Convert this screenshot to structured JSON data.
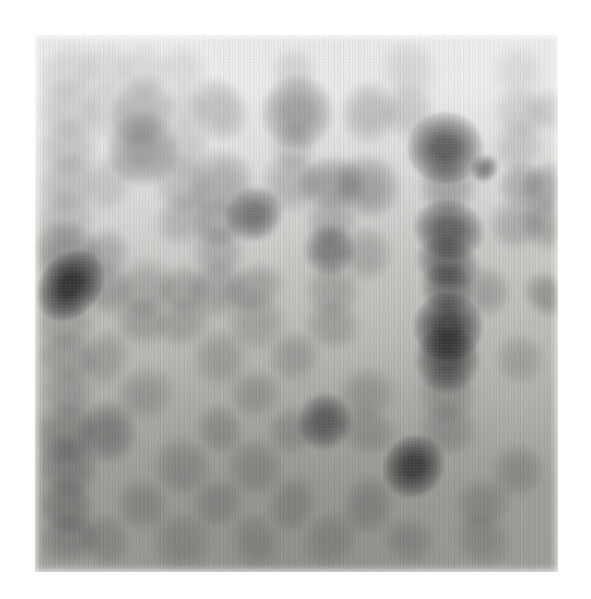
{
  "image": {
    "kind": "dot-blot-autoradiograph",
    "description": "Grayscale autoradiograph of a dot blot / macroarray membrane showing a grid of hybridization spots of varying intensity",
    "canvas_width": 591,
    "canvas_height": 599,
    "background_color": "#ffffff"
  },
  "membrane": {
    "x": 35,
    "y": 35,
    "width": 523,
    "height": 537,
    "tone_top": "#ececea",
    "tone_mid": "#c9c8c4",
    "tone_bottom": "#a7a6a2",
    "grain_color": "#7d7c78",
    "edge_softness_px": 7
  },
  "chart_data": {
    "type": "heatmap",
    "title": "",
    "subtitle": "",
    "xlabel": "",
    "ylabel": "",
    "grid": false,
    "legend": null,
    "columns": 14,
    "rows": 13,
    "col_centers": [
      68,
      105,
      143,
      181,
      218,
      256,
      293,
      330,
      368,
      410,
      447,
      484,
      520,
      547
    ],
    "row_centers": [
      70,
      108,
      145,
      183,
      220,
      248,
      283,
      320,
      355,
      392,
      428,
      466,
      505,
      540
    ],
    "intensity_scale": [
      0,
      1
    ],
    "spots": [
      {
        "col": 0,
        "row": 0,
        "x": 68,
        "y": 72,
        "r": 15,
        "intensity": 0.06
      },
      {
        "col": 1,
        "row": 0,
        "x": 106,
        "y": 70,
        "r": 14,
        "intensity": 0.05
      },
      {
        "col": 2,
        "row": 0,
        "x": 144,
        "y": 72,
        "r": 15,
        "intensity": 0.07
      },
      {
        "col": 3,
        "row": 0,
        "x": 182,
        "y": 70,
        "r": 14,
        "intensity": 0.05
      },
      {
        "col": 6,
        "row": 0,
        "x": 296,
        "y": 72,
        "r": 14,
        "intensity": 0.06
      },
      {
        "col": 9,
        "row": 0,
        "x": 410,
        "y": 72,
        "r": 14,
        "intensity": 0.05
      },
      {
        "col": 12,
        "row": 0,
        "x": 520,
        "y": 72,
        "r": 14,
        "intensity": 0.05
      },
      {
        "col": 0,
        "row": 1,
        "x": 68,
        "y": 110,
        "r": 16,
        "intensity": 0.14
      },
      {
        "col": 1,
        "row": 1,
        "x": 106,
        "y": 108,
        "r": 15,
        "intensity": 0.1
      },
      {
        "col": 2,
        "row": 1,
        "x": 144,
        "y": 110,
        "r": 18,
        "intensity": 0.4
      },
      {
        "col": 3,
        "row": 1,
        "x": 182,
        "y": 108,
        "r": 14,
        "intensity": 0.1
      },
      {
        "col": 4,
        "row": 1,
        "x": 219,
        "y": 110,
        "r": 16,
        "intensity": 0.26
      },
      {
        "col": 6,
        "row": 1,
        "x": 296,
        "y": 112,
        "r": 18,
        "intensity": 0.45
      },
      {
        "col": 8,
        "row": 1,
        "x": 370,
        "y": 110,
        "r": 15,
        "intensity": 0.22
      },
      {
        "col": 9,
        "row": 1,
        "x": 410,
        "y": 110,
        "r": 14,
        "intensity": 0.13
      },
      {
        "col": 12,
        "row": 1,
        "x": 520,
        "y": 112,
        "r": 14,
        "intensity": 0.12
      },
      {
        "col": 13,
        "row": 1,
        "x": 548,
        "y": 112,
        "r": 13,
        "intensity": 0.1
      },
      {
        "col": 0,
        "row": 2,
        "x": 68,
        "y": 147,
        "r": 16,
        "intensity": 0.16
      },
      {
        "col": 2,
        "row": 2,
        "x": 144,
        "y": 148,
        "r": 18,
        "intensity": 0.52
      },
      {
        "col": 3,
        "row": 2,
        "x": 182,
        "y": 146,
        "r": 15,
        "intensity": 0.14
      },
      {
        "col": 6,
        "row": 2,
        "x": 293,
        "y": 147,
        "r": 14,
        "intensity": 0.12
      },
      {
        "col": 10,
        "row": 2,
        "x": 447,
        "y": 147,
        "r": 20,
        "intensity": 0.88
      },
      {
        "col": 12,
        "row": 2,
        "x": 518,
        "y": 147,
        "r": 14,
        "intensity": 0.13
      },
      {
        "col": 0,
        "row": 3,
        "x": 68,
        "y": 184,
        "r": 15,
        "intensity": 0.15
      },
      {
        "col": 1,
        "row": 3,
        "x": 106,
        "y": 183,
        "r": 14,
        "intensity": 0.12
      },
      {
        "col": 3,
        "row": 3,
        "x": 182,
        "y": 184,
        "r": 15,
        "intensity": 0.18
      },
      {
        "col": 4,
        "row": 3,
        "x": 219,
        "y": 182,
        "r": 16,
        "intensity": 0.3
      },
      {
        "col": 6,
        "row": 3,
        "x": 293,
        "y": 184,
        "r": 14,
        "intensity": 0.2
      },
      {
        "col": 7,
        "row": 3,
        "x": 331,
        "y": 183,
        "r": 16,
        "intensity": 0.32
      },
      {
        "col": 8,
        "row": 3,
        "x": 368,
        "y": 184,
        "r": 16,
        "intensity": 0.3
      },
      {
        "col": 10,
        "row": 3,
        "x": 447,
        "y": 186,
        "r": 15,
        "intensity": 0.3
      },
      {
        "col": 11,
        "row": 3,
        "x": 484,
        "y": 167,
        "r": 7,
        "intensity": 0.62
      },
      {
        "col": 12,
        "row": 3,
        "x": 520,
        "y": 186,
        "r": 14,
        "intensity": 0.24
      },
      {
        "col": 13,
        "row": 3,
        "x": 548,
        "y": 186,
        "r": 14,
        "intensity": 0.26
      },
      {
        "col": 0,
        "row": 4,
        "x": 68,
        "y": 220,
        "r": 14,
        "intensity": 0.12
      },
      {
        "col": 3,
        "row": 4,
        "x": 182,
        "y": 218,
        "r": 15,
        "intensity": 0.2
      },
      {
        "col": 4,
        "row": 4,
        "x": 219,
        "y": 220,
        "r": 15,
        "intensity": 0.24
      },
      {
        "col": 5,
        "row": 4,
        "x": 256,
        "y": 213,
        "r": 14,
        "intensity": 0.66
      },
      {
        "col": 7,
        "row": 4,
        "x": 331,
        "y": 222,
        "r": 14,
        "intensity": 0.18
      },
      {
        "col": 10,
        "row": 4,
        "x": 447,
        "y": 228,
        "r": 18,
        "intensity": 0.7
      },
      {
        "col": 12,
        "row": 4,
        "x": 520,
        "y": 222,
        "r": 14,
        "intensity": 0.18
      },
      {
        "col": 13,
        "row": 4,
        "x": 548,
        "y": 224,
        "r": 14,
        "intensity": 0.2
      },
      {
        "col": 0,
        "row": 5,
        "x": 68,
        "y": 252,
        "r": 17,
        "intensity": 0.36
      },
      {
        "col": 1,
        "row": 5,
        "x": 106,
        "y": 252,
        "r": 14,
        "intensity": 0.2
      },
      {
        "col": 4,
        "row": 5,
        "x": 219,
        "y": 252,
        "r": 14,
        "intensity": 0.18
      },
      {
        "col": 7,
        "row": 5,
        "x": 328,
        "y": 252,
        "r": 14,
        "intensity": 0.48
      },
      {
        "col": 8,
        "row": 5,
        "x": 368,
        "y": 255,
        "r": 14,
        "intensity": 0.16
      },
      {
        "col": 10,
        "row": 5,
        "x": 447,
        "y": 262,
        "r": 15,
        "intensity": 0.58
      },
      {
        "col": 0,
        "row": 6,
        "x": 68,
        "y": 285,
        "r": 18,
        "intensity": 0.95
      },
      {
        "col": 1,
        "row": 6,
        "x": 106,
        "y": 287,
        "r": 14,
        "intensity": 0.22
      },
      {
        "col": 2,
        "row": 6,
        "x": 144,
        "y": 289,
        "r": 14,
        "intensity": 0.16
      },
      {
        "col": 3,
        "row": 6,
        "x": 182,
        "y": 289,
        "r": 14,
        "intensity": 0.18
      },
      {
        "col": 4,
        "row": 6,
        "x": 219,
        "y": 289,
        "r": 14,
        "intensity": 0.18
      },
      {
        "col": 5,
        "row": 6,
        "x": 256,
        "y": 289,
        "r": 14,
        "intensity": 0.18
      },
      {
        "col": 7,
        "row": 6,
        "x": 331,
        "y": 289,
        "r": 14,
        "intensity": 0.16
      },
      {
        "col": 10,
        "row": 6,
        "x": 447,
        "y": 289,
        "r": 15,
        "intensity": 0.5
      },
      {
        "col": 11,
        "row": 6,
        "x": 484,
        "y": 292,
        "r": 13,
        "intensity": 0.18
      },
      {
        "col": 13,
        "row": 6,
        "x": 548,
        "y": 296,
        "r": 13,
        "intensity": 0.26
      },
      {
        "col": 0,
        "row": 7,
        "x": 68,
        "y": 322,
        "r": 14,
        "intensity": 0.14
      },
      {
        "col": 2,
        "row": 7,
        "x": 144,
        "y": 322,
        "r": 14,
        "intensity": 0.16
      },
      {
        "col": 3,
        "row": 7,
        "x": 182,
        "y": 322,
        "r": 14,
        "intensity": 0.16
      },
      {
        "col": 5,
        "row": 7,
        "x": 256,
        "y": 322,
        "r": 14,
        "intensity": 0.14
      },
      {
        "col": 7,
        "row": 7,
        "x": 331,
        "y": 325,
        "r": 14,
        "intensity": 0.16
      },
      {
        "col": 10,
        "row": 7,
        "x": 447,
        "y": 328,
        "r": 17,
        "intensity": 0.82
      },
      {
        "col": 0,
        "row": 8,
        "x": 68,
        "y": 358,
        "r": 14,
        "intensity": 0.16
      },
      {
        "col": 1,
        "row": 8,
        "x": 106,
        "y": 360,
        "r": 14,
        "intensity": 0.14
      },
      {
        "col": 4,
        "row": 8,
        "x": 219,
        "y": 358,
        "r": 14,
        "intensity": 0.14
      },
      {
        "col": 6,
        "row": 8,
        "x": 293,
        "y": 358,
        "r": 14,
        "intensity": 0.14
      },
      {
        "col": 10,
        "row": 8,
        "x": 447,
        "y": 360,
        "r": 16,
        "intensity": 0.72
      },
      {
        "col": 12,
        "row": 8,
        "x": 520,
        "y": 358,
        "r": 13,
        "intensity": 0.12
      },
      {
        "col": 0,
        "row": 9,
        "x": 68,
        "y": 394,
        "r": 14,
        "intensity": 0.16
      },
      {
        "col": 2,
        "row": 9,
        "x": 144,
        "y": 394,
        "r": 14,
        "intensity": 0.14
      },
      {
        "col": 5,
        "row": 9,
        "x": 256,
        "y": 394,
        "r": 14,
        "intensity": 0.14
      },
      {
        "col": 8,
        "row": 9,
        "x": 368,
        "y": 394,
        "r": 14,
        "intensity": 0.14
      },
      {
        "col": 10,
        "row": 9,
        "x": 447,
        "y": 394,
        "r": 14,
        "intensity": 0.2
      },
      {
        "col": 0,
        "row": 10,
        "x": 68,
        "y": 430,
        "r": 16,
        "intensity": 0.26
      },
      {
        "col": 1,
        "row": 10,
        "x": 106,
        "y": 432,
        "r": 15,
        "intensity": 0.34
      },
      {
        "col": 4,
        "row": 10,
        "x": 219,
        "y": 430,
        "r": 14,
        "intensity": 0.18
      },
      {
        "col": 6,
        "row": 10,
        "x": 293,
        "y": 430,
        "r": 14,
        "intensity": 0.16
      },
      {
        "col": 8,
        "row": 10,
        "x": 368,
        "y": 430,
        "r": 14,
        "intensity": 0.16
      },
      {
        "col": 10,
        "row": 10,
        "x": 447,
        "y": 430,
        "r": 14,
        "intensity": 0.18
      },
      {
        "col": 0,
        "row": 11,
        "x": 68,
        "y": 466,
        "r": 16,
        "intensity": 0.3
      },
      {
        "col": 3,
        "row": 11,
        "x": 182,
        "y": 466,
        "r": 14,
        "intensity": 0.16
      },
      {
        "col": 5,
        "row": 11,
        "x": 256,
        "y": 466,
        "r": 14,
        "intensity": 0.16
      },
      {
        "col": 7,
        "row": 11,
        "x": 325,
        "y": 420,
        "r": 15,
        "intensity": 0.62
      },
      {
        "col": 10,
        "row": 11,
        "x": 412,
        "y": 466,
        "r": 17,
        "intensity": 0.85
      },
      {
        "col": 12,
        "row": 11,
        "x": 520,
        "y": 470,
        "r": 14,
        "intensity": 0.16
      },
      {
        "col": 0,
        "row": 12,
        "x": 68,
        "y": 505,
        "r": 16,
        "intensity": 0.3
      },
      {
        "col": 2,
        "row": 12,
        "x": 144,
        "y": 505,
        "r": 14,
        "intensity": 0.16
      },
      {
        "col": 4,
        "row": 12,
        "x": 219,
        "y": 505,
        "r": 14,
        "intensity": 0.16
      },
      {
        "col": 6,
        "row": 12,
        "x": 293,
        "y": 505,
        "r": 14,
        "intensity": 0.16
      },
      {
        "col": 8,
        "row": 12,
        "x": 368,
        "y": 505,
        "r": 14,
        "intensity": 0.18
      },
      {
        "col": 11,
        "row": 12,
        "x": 484,
        "y": 505,
        "r": 14,
        "intensity": 0.16
      },
      {
        "col": 0,
        "row": 13,
        "x": 68,
        "y": 540,
        "r": 15,
        "intensity": 0.22
      },
      {
        "col": 1,
        "row": 13,
        "x": 106,
        "y": 542,
        "r": 14,
        "intensity": 0.16
      },
      {
        "col": 3,
        "row": 13,
        "x": 182,
        "y": 540,
        "r": 14,
        "intensity": 0.14
      },
      {
        "col": 5,
        "row": 13,
        "x": 256,
        "y": 542,
        "r": 14,
        "intensity": 0.14
      },
      {
        "col": 7,
        "row": 13,
        "x": 331,
        "y": 540,
        "r": 14,
        "intensity": 0.14
      },
      {
        "col": 9,
        "row": 13,
        "x": 410,
        "y": 542,
        "r": 14,
        "intensity": 0.14
      },
      {
        "col": 11,
        "row": 13,
        "x": 484,
        "y": 540,
        "r": 14,
        "intensity": 0.14
      }
    ]
  }
}
